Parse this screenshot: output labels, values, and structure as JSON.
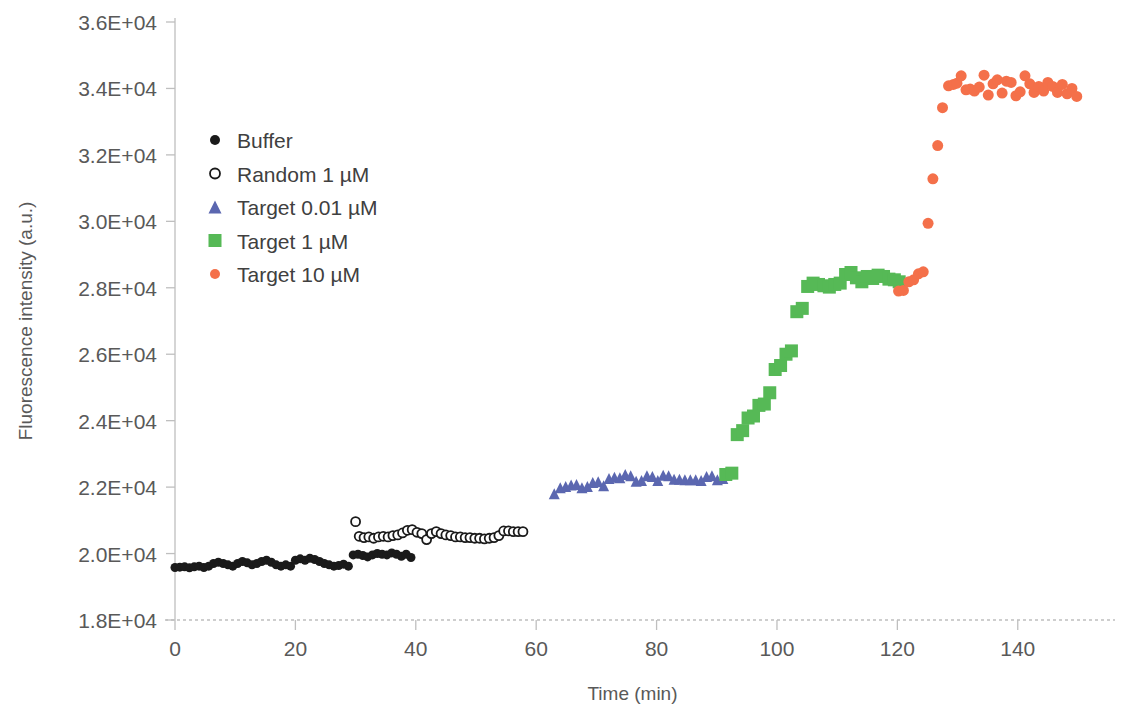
{
  "chart_data": {
    "type": "scatter",
    "title": "",
    "xlabel": "Time (min)",
    "ylabel": "Fluorescence intensity (a.u.)",
    "xlim": [
      0,
      152
    ],
    "ylim": [
      18000,
      36000
    ],
    "xticks": [
      0,
      20,
      40,
      60,
      80,
      100,
      120,
      140
    ],
    "xtick_labels": [
      "0",
      "20",
      "40",
      "60",
      "80",
      "100",
      "120",
      "140"
    ],
    "yticks": [
      18000,
      20000,
      22000,
      24000,
      26000,
      28000,
      30000,
      32000,
      34000,
      36000
    ],
    "ytick_labels": [
      "1.8E+04",
      "2.0E+04",
      "2.2E+04",
      "2.4E+04",
      "2.6E+04",
      "2.8E+04",
      "3.0E+04",
      "3.2E+04",
      "3.4E+04",
      "3.6E+04"
    ],
    "grid": false,
    "legend_position": "upper-left-inside",
    "series": [
      {
        "name": "Buffer",
        "marker": "filled-circle",
        "color": "#1a1a1a",
        "size": 9,
        "points": [
          [
            0.0,
            19580
          ],
          [
            0.8,
            19590
          ],
          [
            1.6,
            19600
          ],
          [
            2.4,
            19570
          ],
          [
            3.2,
            19600
          ],
          [
            4.0,
            19620
          ],
          [
            4.8,
            19580
          ],
          [
            5.6,
            19620
          ],
          [
            6.4,
            19700
          ],
          [
            7.2,
            19740
          ],
          [
            8.0,
            19700
          ],
          [
            8.8,
            19660
          ],
          [
            9.6,
            19620
          ],
          [
            10.4,
            19700
          ],
          [
            11.2,
            19760
          ],
          [
            12.0,
            19720
          ],
          [
            12.8,
            19660
          ],
          [
            13.6,
            19700
          ],
          [
            14.4,
            19760
          ],
          [
            15.2,
            19800
          ],
          [
            16.0,
            19740
          ],
          [
            16.8,
            19660
          ],
          [
            17.6,
            19620
          ],
          [
            18.4,
            19660
          ],
          [
            19.2,
            19620
          ],
          [
            20.0,
            19800
          ],
          [
            20.8,
            19840
          ],
          [
            21.6,
            19800
          ],
          [
            22.4,
            19860
          ],
          [
            23.2,
            19820
          ],
          [
            24.0,
            19760
          ],
          [
            24.8,
            19700
          ],
          [
            25.6,
            19660
          ],
          [
            26.4,
            19620
          ],
          [
            27.2,
            19640
          ],
          [
            28.0,
            19680
          ],
          [
            28.8,
            19620
          ],
          [
            29.6,
            19960
          ],
          [
            30.4,
            19980
          ],
          [
            31.2,
            19940
          ],
          [
            32.0,
            19900
          ],
          [
            32.8,
            19960
          ],
          [
            33.6,
            20000
          ],
          [
            34.4,
            19980
          ],
          [
            35.2,
            19960
          ],
          [
            36.0,
            20020
          ],
          [
            36.8,
            19980
          ],
          [
            37.6,
            19920
          ],
          [
            38.4,
            19980
          ],
          [
            39.2,
            19880
          ]
        ]
      },
      {
        "name": "Random 1 µM",
        "marker": "open-circle",
        "color": "#1a1a1a",
        "size": 9,
        "points": [
          [
            30.0,
            20960
          ],
          [
            30.6,
            20520
          ],
          [
            31.4,
            20480
          ],
          [
            32.2,
            20500
          ],
          [
            33.0,
            20460
          ],
          [
            33.8,
            20500
          ],
          [
            34.6,
            20520
          ],
          [
            35.4,
            20500
          ],
          [
            36.2,
            20540
          ],
          [
            37.0,
            20560
          ],
          [
            37.8,
            20620
          ],
          [
            38.6,
            20700
          ],
          [
            39.4,
            20720
          ],
          [
            40.2,
            20640
          ],
          [
            41.0,
            20600
          ],
          [
            41.8,
            20420
          ],
          [
            42.6,
            20600
          ],
          [
            43.4,
            20660
          ],
          [
            44.2,
            20600
          ],
          [
            45.0,
            20560
          ],
          [
            45.8,
            20540
          ],
          [
            46.6,
            20500
          ],
          [
            47.4,
            20500
          ],
          [
            48.2,
            20480
          ],
          [
            49.0,
            20480
          ],
          [
            49.8,
            20460
          ],
          [
            50.6,
            20460
          ],
          [
            51.4,
            20440
          ],
          [
            52.2,
            20460
          ],
          [
            53.0,
            20480
          ],
          [
            53.8,
            20540
          ],
          [
            54.6,
            20680
          ],
          [
            55.4,
            20680
          ],
          [
            56.2,
            20660
          ],
          [
            57.0,
            20660
          ],
          [
            57.8,
            20660
          ]
        ]
      },
      {
        "name": "Target 0.01 µM",
        "marker": "triangle",
        "color": "#5b67b0",
        "size": 11,
        "points": [
          [
            63.0,
            21800
          ],
          [
            64.0,
            21980
          ],
          [
            64.9,
            22020
          ],
          [
            65.8,
            22060
          ],
          [
            66.7,
            22080
          ],
          [
            67.6,
            21980
          ],
          [
            68.5,
            22020
          ],
          [
            69.4,
            22140
          ],
          [
            70.3,
            22160
          ],
          [
            71.2,
            22040
          ],
          [
            72.1,
            22260
          ],
          [
            73.0,
            22300
          ],
          [
            73.9,
            22280
          ],
          [
            74.8,
            22380
          ],
          [
            75.7,
            22340
          ],
          [
            76.6,
            22180
          ],
          [
            77.5,
            22200
          ],
          [
            78.4,
            22340
          ],
          [
            79.3,
            22320
          ],
          [
            80.2,
            22200
          ],
          [
            81.1,
            22360
          ],
          [
            82.0,
            22340
          ],
          [
            82.9,
            22240
          ],
          [
            83.8,
            22240
          ],
          [
            84.7,
            22220
          ],
          [
            85.6,
            22220
          ],
          [
            86.5,
            22220
          ],
          [
            87.4,
            22200
          ],
          [
            88.3,
            22320
          ],
          [
            89.2,
            22340
          ],
          [
            90.1,
            22220
          ],
          [
            91.0,
            22260
          ]
        ]
      },
      {
        "name": "Target 1 µM",
        "marker": "square",
        "color": "#56b956",
        "size": 13,
        "points": [
          [
            91.5,
            22380
          ],
          [
            92.5,
            22420
          ],
          [
            93.4,
            23580
          ],
          [
            94.3,
            23700
          ],
          [
            95.2,
            24080
          ],
          [
            96.1,
            24140
          ],
          [
            97.0,
            24460
          ],
          [
            97.9,
            24500
          ],
          [
            98.8,
            24840
          ],
          [
            99.7,
            25540
          ],
          [
            100.6,
            25660
          ],
          [
            101.5,
            26000
          ],
          [
            102.4,
            26100
          ],
          [
            103.3,
            27280
          ],
          [
            104.2,
            27380
          ],
          [
            105.1,
            28040
          ],
          [
            106.0,
            28140
          ],
          [
            106.9,
            28100
          ],
          [
            107.8,
            28060
          ],
          [
            108.7,
            28020
          ],
          [
            109.6,
            28100
          ],
          [
            110.5,
            28140
          ],
          [
            111.4,
            28400
          ],
          [
            112.3,
            28460
          ],
          [
            113.2,
            28300
          ],
          [
            114.1,
            28180
          ],
          [
            115.0,
            28340
          ],
          [
            115.9,
            28280
          ],
          [
            116.8,
            28380
          ],
          [
            117.7,
            28340
          ],
          [
            118.6,
            28260
          ],
          [
            119.5,
            28240
          ],
          [
            120.3,
            28180
          ]
        ]
      },
      {
        "name": "Target 10 µM",
        "marker": "filled-circle",
        "color": "#f4704a",
        "size": 11,
        "points": [
          [
            120.2,
            27900
          ],
          [
            121.0,
            27920
          ],
          [
            121.9,
            28180
          ],
          [
            122.7,
            28240
          ],
          [
            123.5,
            28420
          ],
          [
            124.3,
            28480
          ],
          [
            125.1,
            29940
          ],
          [
            125.9,
            31280
          ],
          [
            126.7,
            32280
          ],
          [
            127.5,
            33420
          ],
          [
            128.5,
            34080
          ],
          [
            129.3,
            34120
          ],
          [
            129.9,
            34160
          ],
          [
            130.6,
            34380
          ],
          [
            131.4,
            33960
          ],
          [
            132.1,
            33980
          ],
          [
            132.8,
            33920
          ],
          [
            133.6,
            34040
          ],
          [
            134.4,
            34400
          ],
          [
            135.1,
            33800
          ],
          [
            135.9,
            34140
          ],
          [
            136.6,
            34260
          ],
          [
            137.4,
            33860
          ],
          [
            138.1,
            34220
          ],
          [
            138.9,
            34180
          ],
          [
            139.7,
            33780
          ],
          [
            140.4,
            33900
          ],
          [
            141.2,
            34380
          ],
          [
            142.0,
            34140
          ],
          [
            142.7,
            33880
          ],
          [
            143.5,
            34060
          ],
          [
            144.3,
            33920
          ],
          [
            145.0,
            34180
          ],
          [
            145.8,
            34060
          ],
          [
            146.6,
            33880
          ],
          [
            147.4,
            34120
          ],
          [
            148.2,
            33840
          ],
          [
            149.0,
            34000
          ],
          [
            149.8,
            33760
          ]
        ]
      }
    ]
  },
  "legend": {
    "entries": [
      {
        "label": "Buffer",
        "marker": "filled-circle",
        "color": "#1a1a1a"
      },
      {
        "label": "Random 1 µM",
        "marker": "open-circle",
        "color": "#1a1a1a"
      },
      {
        "label": "Target 0.01 µM",
        "marker": "triangle",
        "color": "#5b67b0"
      },
      {
        "label": "Target 1 µM",
        "marker": "square",
        "color": "#56b956"
      },
      {
        "label": "Target 10 µM",
        "marker": "filled-circle",
        "color": "#f4704a"
      }
    ]
  },
  "axes": {
    "tick_color": "#bfbfbf",
    "axis_color": "#bfbfbf",
    "text_color": "#595959"
  }
}
